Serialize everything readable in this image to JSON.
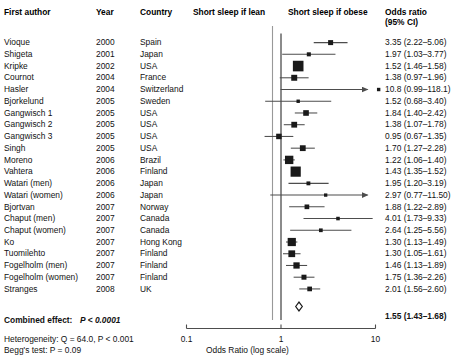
{
  "headers": {
    "author": "First author",
    "year": "Year",
    "country": "Country",
    "lean": "Short sleep if lean",
    "obese": "Short sleep if obese",
    "or_line1": "Odds ratio",
    "or_line2": "(95% CI)"
  },
  "footer": {
    "combined_label": "Combined effect:",
    "combined_p": "P < 0.0001",
    "heterogeneity": "Heterogeneity: Q = 64.0, P < 0.001",
    "begg": "Begg's test: P = 0.09"
  },
  "axis": {
    "title": "Odds Ratio (log scale)",
    "ticks": [
      "0.1",
      "1",
      "10"
    ],
    "tick_values": [
      0.1,
      1,
      10
    ],
    "min": 0.1,
    "max": 10,
    "reference": 1
  },
  "colors": {
    "marker": "#1a1a1a",
    "line": "#4d4d4d",
    "axis": "#4d4d4d",
    "reference_line": "#4d4d4d",
    "separator": "#999999",
    "text": "#111111"
  },
  "chart_data": {
    "type": "forest",
    "title": "",
    "xlabel": "Odds Ratio (log scale)",
    "ylabel": "",
    "xscale": "log",
    "xlim": [
      0.1,
      10
    ],
    "reference_line": 1,
    "grid": false,
    "legend": "none",
    "columns": [
      "First author",
      "Year",
      "Country",
      "Odds ratio (95% CI)"
    ],
    "rows": [
      {
        "author": "Vioque",
        "year": "2000",
        "country": "Spain",
        "or": 3.35,
        "lo": 2.22,
        "hi": 5.06,
        "label": "3.35 (2.22–5.06)",
        "weight": 0.3,
        "clipped": false
      },
      {
        "author": "Shigeta",
        "year": "2001",
        "country": "Japan",
        "or": 1.97,
        "lo": 1.03,
        "hi": 3.77,
        "label": "1.97 (1.03–3.77)",
        "weight": 0.18,
        "clipped": false
      },
      {
        "author": "Kripke",
        "year": "2002",
        "country": "USA",
        "or": 1.52,
        "lo": 1.46,
        "hi": 1.58,
        "label": "1.52 (1.46–1.58)",
        "weight": 1.0,
        "clipped": false
      },
      {
        "author": "Cournot",
        "year": "2004",
        "country": "France",
        "or": 1.38,
        "lo": 0.97,
        "hi": 1.96,
        "label": "1.38 (0.97–1.96)",
        "weight": 0.42,
        "clipped": false
      },
      {
        "author": "Hasler",
        "year": "2004",
        "country": "Switzerland",
        "or": 10.8,
        "lo": 0.99,
        "hi": 118.1,
        "label": "10.8 (0.99–118.1)",
        "weight": 0.1,
        "clipped": true
      },
      {
        "author": "Bjorkelund",
        "year": "2005",
        "country": "Sweden",
        "or": 1.52,
        "lo": 0.68,
        "hi": 3.4,
        "label": "1.52 (0.68–3.40)",
        "weight": 0.1,
        "clipped": false
      },
      {
        "author": "Gangwisch 1",
        "year": "2005",
        "country": "USA",
        "or": 1.84,
        "lo": 1.4,
        "hi": 2.42,
        "label": "1.84 (1.40–2.42)",
        "weight": 0.38,
        "clipped": false
      },
      {
        "author": "Gangwisch 2",
        "year": "2005",
        "country": "USA",
        "or": 1.38,
        "lo": 1.07,
        "hi": 1.78,
        "label": "1.38 (1.07–1.78)",
        "weight": 0.4,
        "clipped": false
      },
      {
        "author": "Gangwisch 3",
        "year": "2005",
        "country": "USA",
        "or": 0.95,
        "lo": 0.67,
        "hi": 1.35,
        "label": "0.95 (0.67–1.35)",
        "weight": 0.36,
        "clipped": false
      },
      {
        "author": "Singh",
        "year": "2005",
        "country": "USA",
        "or": 1.7,
        "lo": 1.27,
        "hi": 2.28,
        "label": "1.70 (1.27–2.28)",
        "weight": 0.4,
        "clipped": false
      },
      {
        "author": "Moreno",
        "year": "2006",
        "country": "Brazil",
        "or": 1.22,
        "lo": 1.06,
        "hi": 1.4,
        "label": "1.22 (1.06–1.40)",
        "weight": 0.72,
        "clipped": false
      },
      {
        "author": "Vahtera",
        "year": "2006",
        "country": "Finland",
        "or": 1.43,
        "lo": 1.35,
        "hi": 1.52,
        "label": "1.43 (1.35–1.52)",
        "weight": 0.95,
        "clipped": false
      },
      {
        "author": "Watari (men)",
        "year": "2006",
        "country": "Japan",
        "or": 1.95,
        "lo": 1.2,
        "hi": 3.19,
        "label": "1.95 (1.20–3.19)",
        "weight": 0.16,
        "clipped": false
      },
      {
        "author": "Watari (women)",
        "year": "2006",
        "country": "Japan",
        "or": 2.97,
        "lo": 0.77,
        "hi": 11.5,
        "label": "2.97 (0.77–11.50)",
        "weight": 0.09,
        "clipped": true
      },
      {
        "author": "Bjortvan",
        "year": "2007",
        "country": "Norway",
        "or": 1.88,
        "lo": 1.22,
        "hi": 2.89,
        "label": "1.88 (1.22–2.89)",
        "weight": 0.26,
        "clipped": false
      },
      {
        "author": "Chaput (men)",
        "year": "2007",
        "country": "Canada",
        "or": 4.01,
        "lo": 1.73,
        "hi": 9.33,
        "label": "4.01 (1.73–9.33)",
        "weight": 0.12,
        "clipped": false
      },
      {
        "author": "Chaput (women)",
        "year": "2007",
        "country": "Canada",
        "or": 2.64,
        "lo": 1.25,
        "hi": 5.56,
        "label": "2.64 (1.25–5.56)",
        "weight": 0.14,
        "clipped": false
      },
      {
        "author": "Ko",
        "year": "2007",
        "country": "Hong Kong",
        "or": 1.3,
        "lo": 1.13,
        "hi": 1.49,
        "label": "1.30 (1.13–1.49)",
        "weight": 0.7,
        "clipped": false
      },
      {
        "author": "Tuomilehto",
        "year": "2007",
        "country": "Finland",
        "or": 1.3,
        "lo": 1.05,
        "hi": 1.61,
        "label": "1.30 (1.05–1.61)",
        "weight": 0.52,
        "clipped": false
      },
      {
        "author": "Fogelholm (men)",
        "year": "2007",
        "country": "Finland",
        "or": 1.46,
        "lo": 1.13,
        "hi": 1.89,
        "label": "1.46 (1.13–1.89)",
        "weight": 0.46,
        "clipped": false
      },
      {
        "author": "Fogelholm (women)",
        "year": "2007",
        "country": "Finland",
        "or": 1.75,
        "lo": 1.36,
        "hi": 2.26,
        "label": "1.75 (1.36–2.26)",
        "weight": 0.3,
        "clipped": false
      },
      {
        "author": "Stranges",
        "year": "2008",
        "country": "UK",
        "or": 2.01,
        "lo": 1.56,
        "hi": 2.6,
        "label": "2.01 (1.56–2.60)",
        "weight": 0.26,
        "clipped": false
      }
    ],
    "summary": {
      "or": 1.55,
      "lo": 1.43,
      "hi": 1.68,
      "label": "1.55 (1.43–1.68)"
    }
  }
}
